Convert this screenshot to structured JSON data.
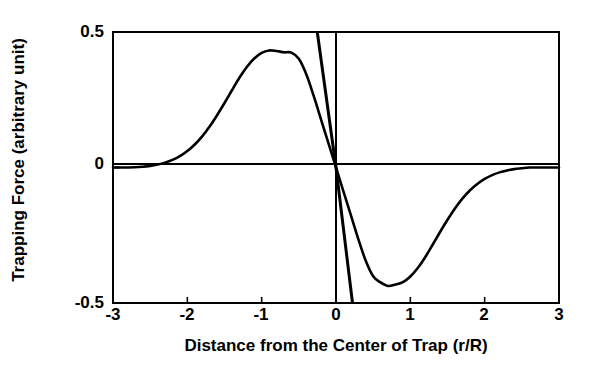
{
  "chart_data": {
    "type": "line",
    "title": "",
    "xlabel": "Distance from the Center of Trap (r/R)",
    "ylabel": "Trapping Force (arbitrary unit)",
    "xlim": [
      -3,
      3
    ],
    "ylim": [
      -0.5,
      0.5
    ],
    "xticks": [
      -3,
      -2,
      -1,
      0,
      1,
      2,
      3
    ],
    "xtick_labels": [
      "-3",
      "-2",
      "-1",
      "0",
      "1",
      "2",
      "3"
    ],
    "yticks": [
      -0.5,
      0,
      0.5
    ],
    "ytick_labels": [
      "-0.5",
      "0",
      "0.5"
    ],
    "grid": false,
    "legend": "none",
    "frame": "box",
    "line_color": "#000000",
    "background_color": "#ffffff",
    "series": [
      {
        "name": "trapping-force-curve",
        "type": "line",
        "x": [
          -3.0,
          -2.8,
          -2.6,
          -2.5,
          -2.4,
          -2.3,
          -2.2,
          -2.1,
          -2.0,
          -1.9,
          -1.8,
          -1.7,
          -1.6,
          -1.5,
          -1.4,
          -1.3,
          -1.2,
          -1.1,
          -1.0,
          -0.9,
          -0.8,
          -0.7,
          -0.6,
          -0.5,
          -0.4,
          -0.3,
          -0.2,
          -0.1,
          0.0,
          0.1,
          0.2,
          0.3,
          0.4,
          0.5,
          0.6,
          0.7,
          0.8,
          0.9,
          1.0,
          1.1,
          1.2,
          1.3,
          1.4,
          1.5,
          1.6,
          1.7,
          1.8,
          1.9,
          2.0,
          2.1,
          2.2,
          2.3,
          2.4,
          2.5,
          2.6,
          2.8,
          3.0
        ],
        "y": [
          0.0,
          0.0,
          0.003,
          0.006,
          0.011,
          0.018,
          0.028,
          0.042,
          0.061,
          0.085,
          0.115,
          0.151,
          0.193,
          0.238,
          0.285,
          0.331,
          0.371,
          0.402,
          0.423,
          0.432,
          0.43,
          0.425,
          0.424,
          0.401,
          0.344,
          0.264,
          0.176,
          0.088,
          0.0,
          -0.088,
          -0.176,
          -0.264,
          -0.344,
          -0.401,
          -0.424,
          -0.437,
          -0.432,
          -0.423,
          -0.402,
          -0.371,
          -0.331,
          -0.285,
          -0.238,
          -0.193,
          -0.151,
          -0.115,
          -0.085,
          -0.061,
          -0.042,
          -0.028,
          -0.018,
          -0.011,
          -0.006,
          -0.003,
          0.0,
          0.0,
          0.0
        ]
      },
      {
        "name": "linear-tangent-line",
        "type": "line",
        "x": [
          -0.252,
          0.0,
          0.222
        ],
        "y": [
          0.5,
          0.0,
          -0.5
        ]
      }
    ],
    "annotations": {
      "peak_value": 0.43,
      "peak_position": -0.65,
      "trough_value": -0.44,
      "trough_position": 0.7,
      "zero_crossing": 0.0
    }
  }
}
